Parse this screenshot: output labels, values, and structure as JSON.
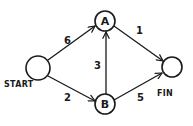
{
  "diagram": {
    "type": "weighted directed graph",
    "nodes": [
      {
        "id": "start",
        "label": "",
        "caption": "START",
        "cx": 38,
        "cy": 68,
        "r": 12
      },
      {
        "id": "a",
        "label": "A",
        "caption": "",
        "cx": 105,
        "cy": 21,
        "r": 10
      },
      {
        "id": "b",
        "label": "B",
        "caption": "",
        "cx": 105,
        "cy": 104,
        "r": 10
      },
      {
        "id": "fin",
        "label": "",
        "caption": "FIN",
        "cx": 171,
        "cy": 67,
        "r": 10
      }
    ],
    "edges": [
      {
        "from": "start",
        "to": "a",
        "weight": "6"
      },
      {
        "from": "start",
        "to": "b",
        "weight": "2"
      },
      {
        "from": "b",
        "to": "a",
        "weight": "3"
      },
      {
        "from": "a",
        "to": "fin",
        "weight": "1"
      },
      {
        "from": "b",
        "to": "fin",
        "weight": "5"
      }
    ],
    "stroke_color": "#1a1a1a",
    "background_color": "#ffffff"
  }
}
